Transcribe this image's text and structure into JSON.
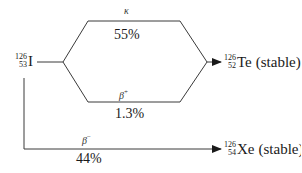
{
  "diagram": {
    "parent": {
      "mass_number": "126",
      "atomic_number": "53",
      "symbol": "I"
    },
    "products": [
      {
        "mass_number": "126",
        "atomic_number": "52",
        "symbol": "Te",
        "note": "(stable)"
      },
      {
        "mass_number": "126",
        "atomic_number": "54",
        "symbol": "Xe",
        "note": "(stable)"
      }
    ],
    "branches": [
      {
        "mode": "κ",
        "mode_sup": "",
        "percent": "55%",
        "to": "Te"
      },
      {
        "mode": "β",
        "mode_sup": "+",
        "percent": "1.3%",
        "to": "Te"
      },
      {
        "mode": "β",
        "mode_sup": "−",
        "percent": "44%",
        "to": "Xe"
      }
    ],
    "colors": {
      "line": "#3a3a3a",
      "text": "#1a1a1a"
    }
  }
}
